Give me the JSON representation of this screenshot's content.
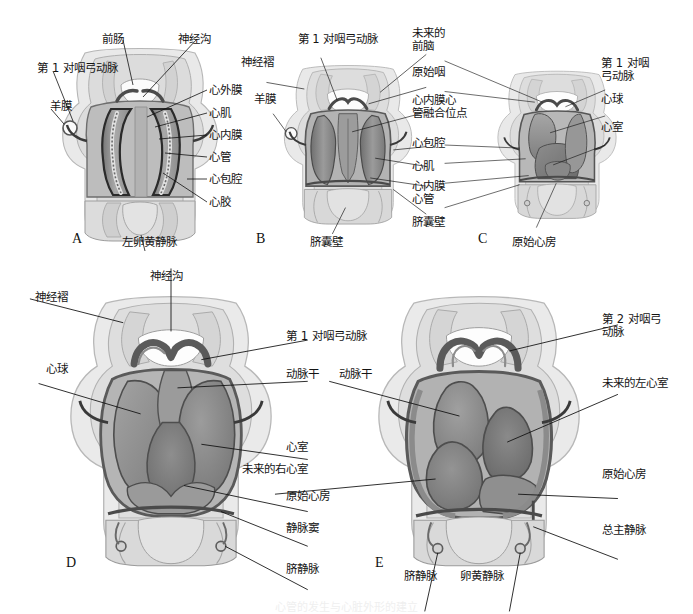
{
  "figure": {
    "type": "anatomical-illustration",
    "style": "grayscale-shaded-drawing",
    "panel_count": 5,
    "caption": "心管的发生与心脏外形的建立"
  },
  "colors": {
    "ink": "#141414",
    "leader_line": "#111111",
    "outer_body": "#e7e7e7",
    "mid_tone": "#c9c9c9",
    "dark_tone": "#8e8e8e",
    "darkest_tone": "#5f5f5f",
    "outline": "#4a4a4a",
    "background": "#ffffff"
  },
  "panels": [
    {
      "id": "A",
      "letter": "A",
      "letter_pos": {
        "x": 72,
        "y": 232
      },
      "labels_left": [
        {
          "text": "第 1 对咽弓动脉",
          "x": 2,
          "y": 66
        },
        {
          "text": "羊膜",
          "x": 47,
          "y": 104
        }
      ],
      "labels_top": [
        {
          "text": "前肠",
          "x": 105,
          "y": 36
        },
        {
          "text": "神经沟",
          "x": 182,
          "y": 36
        }
      ],
      "labels_right": [
        {
          "text": "心外膜",
          "x": 208,
          "y": 83
        },
        {
          "text": "心肌",
          "x": 208,
          "y": 106
        },
        {
          "text": "心内膜",
          "x": 208,
          "y": 128
        },
        {
          "text": "心管",
          "x": 208,
          "y": 150
        },
        {
          "text": "心包腔",
          "x": 208,
          "y": 172
        },
        {
          "text": "心胶",
          "x": 208,
          "y": 196
        }
      ],
      "labels_bottom": [
        {
          "text": "左卵黄静脉",
          "x": 118,
          "y": 240
        }
      ]
    },
    {
      "id": "B",
      "letter": "B",
      "letter_pos": {
        "x": 256,
        "y": 237
      },
      "labels_left": [
        {
          "text": "神经褶",
          "x": 238,
          "y": 59
        },
        {
          "text": "羊膜",
          "x": 253,
          "y": 96
        }
      ],
      "labels_top": [
        {
          "text": "第 1 对咽弓动脉",
          "x": 285,
          "y": 36
        }
      ],
      "labels_right": [
        {
          "text": "未来的\n前脑",
          "x": 413,
          "y": 30
        },
        {
          "text": "原始咽",
          "x": 413,
          "y": 69
        },
        {
          "text": "心内膜心\n管融合位点",
          "x": 413,
          "y": 97
        },
        {
          "text": "心包腔",
          "x": 413,
          "y": 140
        },
        {
          "text": "心肌",
          "x": 413,
          "y": 163
        },
        {
          "text": "心内膜\n心管",
          "x": 413,
          "y": 183
        },
        {
          "text": "脐囊壁",
          "x": 413,
          "y": 218
        }
      ],
      "labels_bottom": [
        {
          "text": "脐囊壁",
          "x": 306,
          "y": 240
        }
      ]
    },
    {
      "id": "C",
      "letter": "C",
      "letter_pos": {
        "x": 478,
        "y": 238
      },
      "labels_right": [
        {
          "text": "第 1 对咽\n弓动脉",
          "x": 602,
          "y": 60
        },
        {
          "text": "心球",
          "x": 602,
          "y": 96
        },
        {
          "text": "心室",
          "x": 602,
          "y": 124
        }
      ],
      "labels_bottom": [
        {
          "text": "原始心房",
          "x": 508,
          "y": 240
        }
      ]
    },
    {
      "id": "D",
      "letter": "D",
      "letter_pos": {
        "x": 66,
        "y": 562
      },
      "labels_left": [
        {
          "text": "神经褶",
          "x": 32,
          "y": 294
        },
        {
          "text": "心球",
          "x": 46,
          "y": 366
        }
      ],
      "labels_top": [
        {
          "text": "神经沟",
          "x": 155,
          "y": 273
        }
      ],
      "labels_right": [
        {
          "text": "第 1 对咽弓动脉",
          "x": 286,
          "y": 333
        },
        {
          "text": "动脉干",
          "x": 286,
          "y": 370
        },
        {
          "text": "心室",
          "x": 286,
          "y": 444
        },
        {
          "text": "原始心房",
          "x": 286,
          "y": 493
        },
        {
          "text": "静脉窦",
          "x": 286,
          "y": 525
        },
        {
          "text": "脐静脉",
          "x": 286,
          "y": 566
        }
      ]
    },
    {
      "id": "E",
      "letter": "E",
      "letter_pos": {
        "x": 375,
        "y": 562
      },
      "labels_left": [
        {
          "text": "动脉干",
          "x": 340,
          "y": 370
        }
      ],
      "labels_right": [
        {
          "text": "第 2 对咽弓\n动脉",
          "x": 603,
          "y": 316
        },
        {
          "text": "未来的左心室",
          "x": 603,
          "y": 380
        },
        {
          "text": "原始心房",
          "x": 603,
          "y": 471
        },
        {
          "text": "总主静脉",
          "x": 603,
          "y": 527
        }
      ],
      "labels_center": [
        {
          "text": "未来的右心室",
          "x": 304,
          "y": 466
        }
      ],
      "labels_bottom": [
        {
          "text": "脐静脉",
          "x": 405,
          "y": 573
        },
        {
          "text": "卵黄静脉",
          "x": 465,
          "y": 573
        }
      ]
    }
  ]
}
